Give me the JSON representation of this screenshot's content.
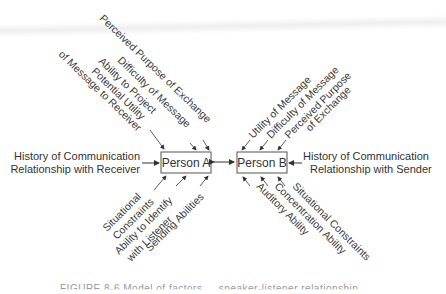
{
  "figure": {
    "caption": "FIGURE 8-6   Model of factors ... speaker-listener relationship",
    "person_a": "Person A",
    "person_b": "Person B",
    "left_history": [
      "History of Communication",
      "Relationship with Receiver"
    ],
    "right_history": [
      "History of Communication",
      "Relationship with Sender"
    ],
    "a_top": [
      "Perceived Purpose of Exchange",
      "Difficulty of Message",
      "Ability to Project",
      "Potential Utility",
      "of Message to Receiver"
    ],
    "a_bottom": [
      "Situational",
      "Constraints",
      "Ability to Identify",
      "with Listener",
      "Sending Abilities"
    ],
    "b_top": [
      "Utility of Message",
      "Difficulty of Message",
      "Perceived Purpose",
      "of Exchange"
    ],
    "b_bottom": [
      "Auditory Ability",
      "Concentration Ability",
      "Situational Constraints"
    ]
  }
}
